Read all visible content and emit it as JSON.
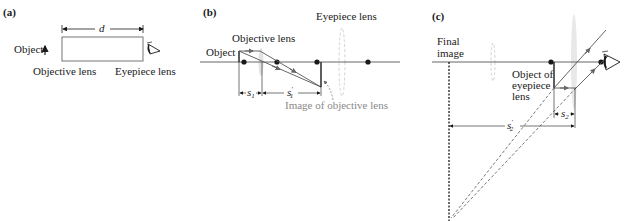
{
  "panels": {
    "a": {
      "label": "(a)",
      "object": "Object",
      "distance": "d",
      "objective_lens": "Objective lens",
      "eyepiece_lens": "Eyepiece lens"
    },
    "b": {
      "label": "(b)",
      "eyepiece_lens": "Eyepiece lens",
      "objective_lens": "Objective lens",
      "object": "Object",
      "s1": "s",
      "s1_sub": "1",
      "s1p": "s",
      "s1p_sup": "′",
      "s1p_sub": "1",
      "image_label": "Image of objective lens"
    },
    "c": {
      "label": "(c)",
      "final_image_line1": "Final",
      "final_image_line2": "image",
      "object_line1": "Object of",
      "object_line2": "eyepiece",
      "object_line3": "lens",
      "s2": "s",
      "s2_sub": "2",
      "s2p": "s",
      "s2p_sup": "′",
      "s2p_sub": "2"
    }
  },
  "colors": {
    "line": "#1a1a1a",
    "axis": "#555555",
    "lens": "#c8c8c8",
    "gray_text": "#8a8a8a"
  }
}
